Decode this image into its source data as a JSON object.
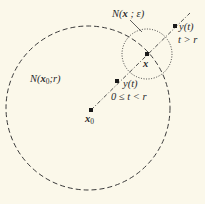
{
  "diagram": {
    "type": "geometric-figure",
    "background_color": "#fbf8ea",
    "ink_color": "#2a2a2a",
    "big_circle": {
      "label_prefix": "N(",
      "label_var": "x",
      "label_sub": "0",
      "label_suffix": ";r)",
      "style": "dashed"
    },
    "small_circle": {
      "label_prefix": "N(",
      "label_var": "x",
      "label_suffix": " ; ε)",
      "style": "dotted"
    },
    "points": {
      "x0": {
        "var": "x",
        "sub": "0"
      },
      "x": {
        "var": "x"
      },
      "y_inner": {
        "label": "y(t)",
        "condition": "0 ≤ t < r"
      },
      "y_outer": {
        "label": "y(t)",
        "condition": "t > r"
      }
    },
    "ray": {
      "style": "dash-dot",
      "from": "x0",
      "through": "x"
    }
  }
}
